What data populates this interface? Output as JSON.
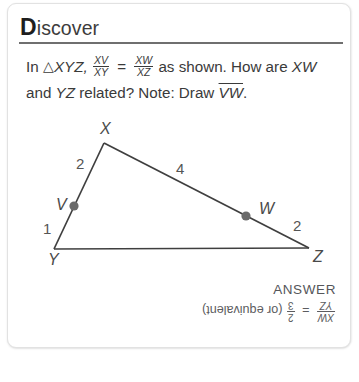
{
  "card": {
    "header": {
      "initial": "D",
      "rest": "iscover"
    },
    "prompt": {
      "seg1": "In",
      "triangle_symbol": "△",
      "triangle_name": "XYZ,",
      "frac1_num": "XV",
      "frac1_den": "XY",
      "equals": "=",
      "frac2_num": "XW",
      "frac2_den": "XZ",
      "seg2": "as shown. How are",
      "seg3_a": "XW",
      "seg3_b": "and",
      "seg3_c": "YZ",
      "seg3_d": "related? Note: Draw",
      "segment_vw": "VW",
      "period": "."
    },
    "figure": {
      "vertices": {
        "x": "X",
        "y": "Y",
        "z": "Z",
        "v": "V",
        "w": "W"
      },
      "measures": {
        "xv": "2",
        "vy": "1",
        "xw": "4",
        "wz": "2"
      },
      "point_color": "#6b6b6b",
      "line_color": "#3f3f3f",
      "label_color": "#4a4a4a"
    },
    "answer": {
      "title": "ANSWER",
      "frac_num": "XW",
      "frac_den": "YZ",
      "equals": "=",
      "ratio_num": "2",
      "ratio_den": "3",
      "note": "(or equivalent)"
    }
  }
}
